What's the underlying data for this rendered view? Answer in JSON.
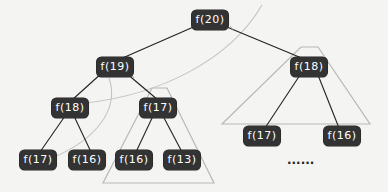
{
  "diagram": {
    "type": "recursion-tree",
    "nodes": [
      {
        "id": "n20",
        "label": "f(20)",
        "x": 210,
        "y": 20
      },
      {
        "id": "n19",
        "label": "f(19)",
        "x": 115,
        "y": 67
      },
      {
        "id": "n18r",
        "label": "f(18)",
        "x": 309,
        "y": 67
      },
      {
        "id": "n18l",
        "label": "f(18)",
        "x": 70,
        "y": 108
      },
      {
        "id": "n17m",
        "label": "f(17)",
        "x": 158,
        "y": 108
      },
      {
        "id": "n17r",
        "label": "f(17)",
        "x": 262,
        "y": 136
      },
      {
        "id": "n16r",
        "label": "f(16)",
        "x": 342,
        "y": 136
      },
      {
        "id": "n17l",
        "label": "f(17)",
        "x": 38,
        "y": 160
      },
      {
        "id": "n16l",
        "label": "f(16)",
        "x": 87,
        "y": 160
      },
      {
        "id": "n16m",
        "label": "f(16)",
        "x": 134,
        "y": 160
      },
      {
        "id": "n13m",
        "label": "f(13)",
        "x": 182,
        "y": 160
      }
    ],
    "ellipsis": "......",
    "colors": {
      "node_fill": "#333333",
      "node_text": "#ffffff",
      "edge": "#222222",
      "triangle": "#b8b8b8",
      "curve": "#c4c4c4",
      "background": "#f4f4f3"
    }
  }
}
